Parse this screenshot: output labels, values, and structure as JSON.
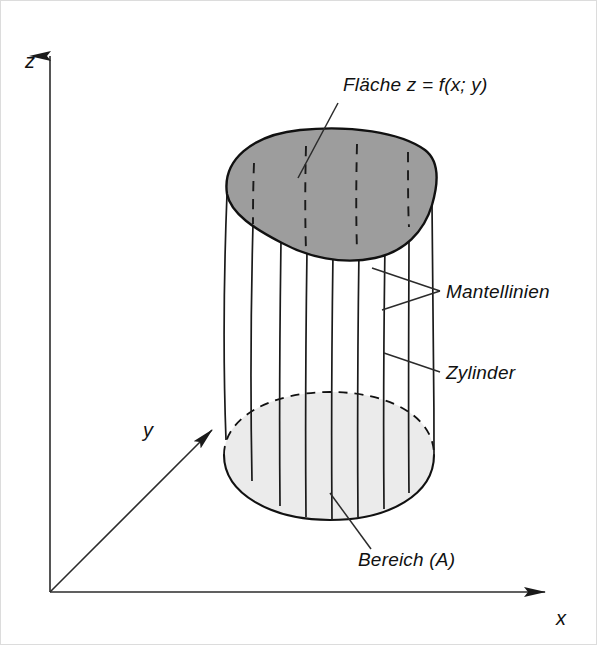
{
  "figure": {
    "title_present": false,
    "background_color": "#ffffff",
    "frame_color": "#d8d8d8",
    "axes": {
      "z": {
        "label": "z",
        "label_x": 30,
        "label_y": 68
      },
      "y": {
        "label": "y",
        "label_x": 148,
        "label_y": 437
      },
      "x": {
        "label": "x",
        "label_y": 625,
        "label_x": 561
      },
      "origin": {
        "x": 50,
        "y": 592
      },
      "color": "#2b2b2b"
    },
    "annotations": [
      {
        "id": "flaeche",
        "text": "Fläche z = f(x; y)",
        "x": 343,
        "y": 91,
        "anchor": "start",
        "leader": {
          "from_x": 338,
          "from_y": 103,
          "to_x": 298,
          "to_y": 178
        }
      },
      {
        "id": "mantellinien",
        "text": "Mantellinien",
        "x": 446,
        "y": 298,
        "anchor": "start",
        "leader": {
          "from_x": 440,
          "from_y": 291,
          "to_x": 372,
          "to_y": 268
        }
      },
      {
        "id": "zylinder",
        "text": "Zylinder",
        "x": 446,
        "y": 379,
        "anchor": "start",
        "leader": {
          "from_x": 440,
          "from_y": 372,
          "to_x": 384,
          "to_y": 353
        }
      },
      {
        "id": "bereich",
        "text": "Bereich (A)",
        "x": 358,
        "y": 566,
        "anchor": "start",
        "leader": {
          "from_x": 371,
          "from_y": 549,
          "to_x": 330,
          "to_y": 500
        }
      }
    ],
    "solid": {
      "name": "zylinder-ueber-bereich",
      "top_surface_fill": "#9d9d9d",
      "top_surface_stroke": "#111111",
      "base_region_fill": "#ebebeb",
      "base_region_stroke": "#111111",
      "generator_line_color": "#1a1a1a",
      "hidden_line_color": "#1a1a1a",
      "generator_count": 9,
      "hidden_dashed_count": 4
    }
  }
}
